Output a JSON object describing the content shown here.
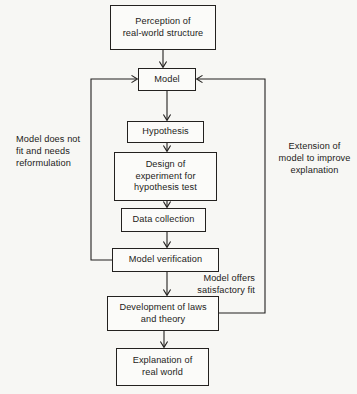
{
  "diagram": {
    "line_color": "#23211f",
    "background_color": "#f7f7f4",
    "nodes": [
      {
        "id": "perception",
        "label": "Perception of\nreal-world structure",
        "x": 110,
        "y": 5,
        "w": 106,
        "h": 45
      },
      {
        "id": "model",
        "label": "Model",
        "x": 138,
        "y": 68,
        "w": 58,
        "h": 23
      },
      {
        "id": "hypothesis",
        "label": "Hypothesis",
        "x": 127,
        "y": 121,
        "w": 77,
        "h": 22
      },
      {
        "id": "design",
        "label": "Design of\nexperiment for\nhypothesis test",
        "x": 114,
        "y": 152,
        "w": 103,
        "h": 49
      },
      {
        "id": "data",
        "label": "Data collection",
        "x": 121,
        "y": 208,
        "w": 85,
        "h": 24
      },
      {
        "id": "verification",
        "label": "Model verification",
        "x": 112,
        "y": 248,
        "w": 107,
        "h": 24
      },
      {
        "id": "development",
        "label": "Development of laws\nand theory",
        "x": 107,
        "y": 296,
        "w": 112,
        "h": 35
      },
      {
        "id": "explanation",
        "label": "Explanation of\nreal world",
        "x": 116,
        "y": 348,
        "w": 93,
        "h": 38
      }
    ],
    "captions": [
      {
        "id": "left-loop-label",
        "text": "Model does not\nfit and needs\nreformulation",
        "x": 16,
        "y": 133,
        "w": 96,
        "align": "left"
      },
      {
        "id": "right-loop-label",
        "text": "Extension of\nmodel to improve\nexplanation",
        "x": 272,
        "y": 140,
        "w": 85,
        "align": "center"
      },
      {
        "id": "satisfactory-fit-label",
        "text": "Model offers\nsatisfactory fit",
        "x": 168,
        "y": 272,
        "w": 87,
        "align": "right"
      }
    ],
    "connectors": [
      {
        "id": "perception-to-model",
        "from": "perception",
        "to": "model",
        "kind": "straight-down"
      },
      {
        "id": "model-to-hypothesis",
        "from": "model",
        "to": "hypothesis",
        "kind": "straight-down"
      },
      {
        "id": "hypothesis-to-design",
        "from": "hypothesis",
        "to": "design",
        "kind": "straight-down"
      },
      {
        "id": "design-to-data",
        "from": "design",
        "to": "data",
        "kind": "straight-down"
      },
      {
        "id": "data-to-verification",
        "from": "data",
        "to": "verification",
        "kind": "straight-down"
      },
      {
        "id": "verification-to-development",
        "from": "verification",
        "to": "development",
        "kind": "straight-down"
      },
      {
        "id": "development-to-explanation",
        "from": "development",
        "to": "explanation",
        "kind": "straight-down"
      },
      {
        "id": "verification-to-model-feedback",
        "from": "verification",
        "to": "model",
        "kind": "loop-left"
      },
      {
        "id": "development-to-model-feedback",
        "from": "development",
        "to": "model",
        "kind": "loop-right"
      }
    ]
  }
}
